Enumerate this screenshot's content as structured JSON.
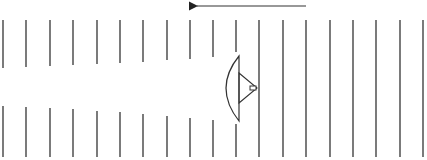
{
  "diagram": {
    "stroke_color": "#333333",
    "arrow": {
      "x1": 306,
      "y1": 6,
      "x2": 191,
      "y2": 6,
      "direction": "left"
    },
    "left_wavefronts": {
      "x": [
        3,
        26,
        50,
        73,
        97,
        120,
        143,
        167,
        190,
        213
      ],
      "top_y1": 20,
      "top_y2": [
        68,
        67,
        66,
        65,
        64,
        63,
        62,
        60,
        59,
        57
      ],
      "bottom_y1": [
        106,
        107,
        108,
        109,
        111,
        112,
        114,
        116,
        118,
        120
      ],
      "bottom_y2": 157
    },
    "split_wavefront": {
      "x": 236,
      "top_y1": 20,
      "top_y2": 52,
      "bottom_y1": 124,
      "bottom_y2": 157
    },
    "right_wavefronts": {
      "x": [
        259,
        283,
        306,
        330,
        353,
        376,
        400,
        423
      ],
      "y1": 20,
      "y2": 157
    },
    "lens": {
      "chord_x": 239,
      "top_y": 56,
      "bottom_y": 121,
      "bulge_x": 226,
      "mid_y": 88
    },
    "source": {
      "triangle": [
        [
          239,
          73
        ],
        [
          257,
          88
        ],
        [
          239,
          103
        ]
      ],
      "rect": {
        "x": 250,
        "y": 86,
        "w": 6,
        "h": 4
      }
    }
  }
}
